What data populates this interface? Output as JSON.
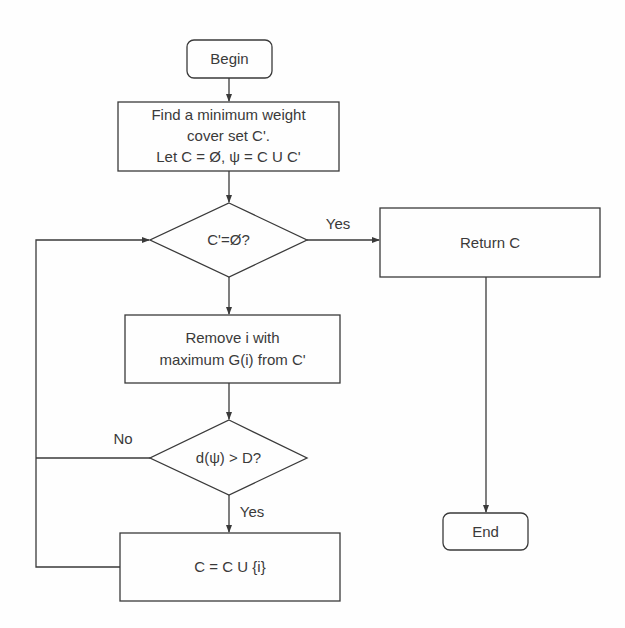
{
  "diagram": {
    "type": "flowchart",
    "nodes": {
      "begin": {
        "label": "Begin",
        "shape": "terminator"
      },
      "find_cover": {
        "lines": [
          "Find a minimum weight",
          "cover set C'.",
          "Let C = Ø, ψ = C U C'"
        ],
        "shape": "process"
      },
      "check_empty": {
        "label": "C'=Ø?",
        "shape": "decision"
      },
      "return_c": {
        "label": "Return C",
        "shape": "process"
      },
      "remove_i": {
        "lines": [
          "Remove i with",
          "maximum G(i) from C'"
        ],
        "shape": "process"
      },
      "check_distance": {
        "label": "d(ψ) > D?",
        "shape": "decision"
      },
      "add_i": {
        "label": "C = C U {i}",
        "shape": "process"
      },
      "end": {
        "label": "End",
        "shape": "terminator"
      }
    },
    "edges": {
      "empty_yes": "Yes",
      "distance_no": "No",
      "distance_yes": "Yes"
    },
    "colors": {
      "stroke": "#3a3a3a",
      "text": "#3a3a3a",
      "background": "#fefefe"
    }
  }
}
